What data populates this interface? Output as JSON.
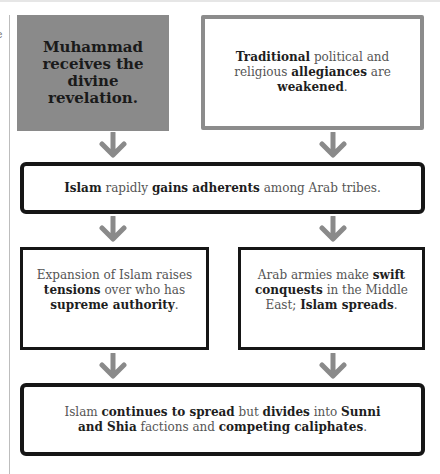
{
  "page": {
    "edge_fragment": "e"
  },
  "colors": {
    "highlight_box_fill": "#8a8a8a",
    "highlight_border": "#8c8c8c",
    "box_border": "#161616",
    "arrow": "#8a8a8a",
    "bold_text": "#1e1e1e",
    "regular_text": "#555555"
  },
  "flowchart": {
    "start_left": {
      "text": "Muhammad receives the divine revelation."
    },
    "start_right": {
      "parts": [
        {
          "t": "Traditional",
          "b": true
        },
        {
          "t": " political and religious ",
          "b": false
        },
        {
          "t": "allegiances",
          "b": true
        },
        {
          "t": " are ",
          "b": false
        },
        {
          "t": "weakened",
          "b": true
        },
        {
          "t": ".",
          "b": false
        }
      ]
    },
    "middle_wide": {
      "parts": [
        {
          "t": "Islam",
          "b": true
        },
        {
          "t": " rapidly ",
          "b": false
        },
        {
          "t": "gains adherents",
          "b": true
        },
        {
          "t": " among Arab tribes.",
          "b": false
        }
      ]
    },
    "branch_left": {
      "parts": [
        {
          "t": "Expansion of Islam raises ",
          "b": false
        },
        {
          "t": "tensions",
          "b": true
        },
        {
          "t": " over who has ",
          "b": false
        },
        {
          "t": "supreme authority",
          "b": true
        },
        {
          "t": ".",
          "b": false
        }
      ]
    },
    "branch_right": {
      "parts": [
        {
          "t": "Arab armies make ",
          "b": false
        },
        {
          "t": "swift conquests",
          "b": true
        },
        {
          "t": " in the Middle East; ",
          "b": false
        },
        {
          "t": "Islam spreads",
          "b": true
        },
        {
          "t": ".",
          "b": false
        }
      ]
    },
    "outcome": {
      "parts": [
        {
          "t": "Islam ",
          "b": false
        },
        {
          "t": "continues to spread",
          "b": true
        },
        {
          "t": " but ",
          "b": false
        },
        {
          "t": "divides",
          "b": true
        },
        {
          "t": " into ",
          "b": false
        },
        {
          "t": "Sunni and Shia",
          "b": true
        },
        {
          "t": " factions and ",
          "b": false
        },
        {
          "t": "competing caliphates",
          "b": true
        },
        {
          "t": ".",
          "b": false
        }
      ]
    },
    "arrows": [
      {
        "from": "start_left",
        "to": "middle_wide",
        "icon": "arrow-down-icon"
      },
      {
        "from": "start_right",
        "to": "middle_wide",
        "icon": "arrow-down-icon"
      },
      {
        "from": "middle_wide",
        "to": "branch_left",
        "icon": "arrow-down-icon"
      },
      {
        "from": "middle_wide",
        "to": "branch_right",
        "icon": "arrow-down-icon"
      },
      {
        "from": "branch_left",
        "to": "outcome",
        "icon": "arrow-down-icon"
      },
      {
        "from": "branch_right",
        "to": "outcome",
        "icon": "arrow-down-icon"
      }
    ]
  }
}
